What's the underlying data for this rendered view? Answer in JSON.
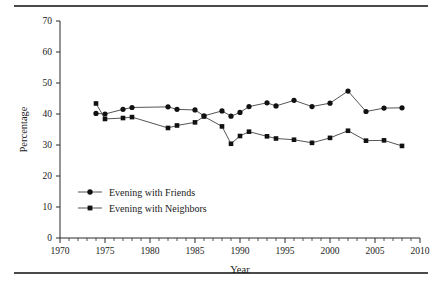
{
  "chart_data": {
    "type": "line",
    "title": "",
    "xlabel": "Year",
    "ylabel": "Percentage",
    "xlim": [
      1970,
      2010
    ],
    "ylim": [
      0,
      70
    ],
    "xticks": [
      1970,
      1975,
      1980,
      1985,
      1990,
      1995,
      2000,
      2005,
      2010
    ],
    "xtick_labels": [
      "1970",
      "1975",
      "1980",
      "1985",
      "1990",
      "1995",
      "2000",
      "2005",
      "2010"
    ],
    "yticks": [
      0,
      10,
      20,
      30,
      40,
      50,
      60,
      70
    ],
    "ytick_labels": [
      "0",
      "10",
      "20",
      "30",
      "40",
      "50",
      "60",
      "70"
    ],
    "x_minor_tick_interval": 1,
    "grid": false,
    "legend_position": "lower-left-inside",
    "series": [
      {
        "name": "Evening with Friends",
        "marker": "circle",
        "x": [
          1974,
          1975,
          1977,
          1978,
          1982,
          1983,
          1985,
          1986,
          1988,
          1989,
          1990,
          1991,
          1993,
          1994,
          1996,
          1998,
          2000,
          2002,
          2004,
          2006,
          2008
        ],
        "values": [
          40.2,
          40.0,
          41.5,
          42.1,
          42.3,
          41.5,
          41.3,
          39.4,
          41.0,
          39.3,
          40.5,
          42.4,
          43.6,
          42.6,
          44.4,
          42.4,
          43.5,
          47.4,
          40.8,
          41.9,
          42.0
        ]
      },
      {
        "name": "Evening with Neighbors",
        "marker": "square",
        "x": [
          1974,
          1975,
          1977,
          1978,
          1982,
          1983,
          1985,
          1986,
          1988,
          1989,
          1990,
          1991,
          1993,
          1994,
          1996,
          1998,
          2000,
          2002,
          2004,
          2006,
          2008
        ],
        "values": [
          43.4,
          38.4,
          38.7,
          39.0,
          35.5,
          36.3,
          37.3,
          39.2,
          36.0,
          30.4,
          32.9,
          34.3,
          32.8,
          32.1,
          31.7,
          30.7,
          32.3,
          34.6,
          31.4,
          31.5,
          29.7
        ]
      }
    ]
  },
  "legend": {
    "items": [
      {
        "label": "Evening with Friends",
        "marker": "circle"
      },
      {
        "label": "Evening with Neighbors",
        "marker": "square"
      }
    ]
  },
  "colors": {
    "line": "#555555",
    "marker": "#111111",
    "axis": "#2b2b2b",
    "text": "#1a1a1a",
    "rule": "#4a4a4a",
    "background": "#ffffff"
  }
}
